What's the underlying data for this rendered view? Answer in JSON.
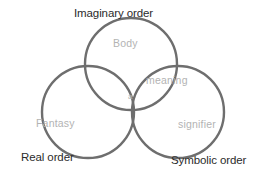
{
  "diagram": {
    "type": "venn",
    "title_visible": false,
    "background_color": "#ffffff",
    "stroke_color": "#6e6e6e",
    "outer_label_color": "#2b2b2b",
    "inner_label_color": "#b3b3b3",
    "circles": [
      {
        "id": "imaginary",
        "label": "Imaginary order",
        "cx": 131,
        "cy": 64,
        "r": 46
      },
      {
        "id": "real",
        "label": "Real order",
        "cx": 88,
        "cy": 112,
        "r": 46
      },
      {
        "id": "symbolic",
        "label": "Symbolic order",
        "cx": 178,
        "cy": 112,
        "r": 46
      }
    ],
    "outer_labels": {
      "imaginary": "Imaginary order",
      "real": "Real order",
      "symbolic": "Symbolic order"
    },
    "region_labels": {
      "imaginary_only": "Body",
      "real_only": "Fantasy",
      "symbolic_only": "signifier",
      "imaginary_symbolic": "meaning",
      "all_three": "a"
    }
  }
}
